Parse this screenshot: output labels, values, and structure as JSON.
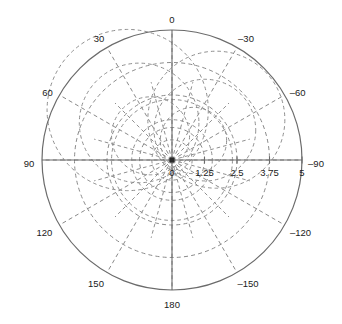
{
  "figure": {
    "name": "polar-plot",
    "background": "#ffffff",
    "axis_color": "#6b6b6b",
    "grid_color": "#8a8a8a",
    "text_color": "#1a1a1a"
  },
  "chart_data": {
    "type": "line",
    "title": "",
    "subtitle": "",
    "xlabel": "",
    "ylabel": "",
    "projection": "polar",
    "grid": true,
    "legend": false,
    "legend_position": "none",
    "center_px": [
      172,
      160
    ],
    "outer_radius_px": 130,
    "radial_axis": {
      "label": "",
      "min": 0,
      "max": 5,
      "ticks": [
        0,
        1.25,
        2.5,
        3.75,
        5
      ],
      "tick_labels": [
        "0",
        "1.25",
        "2.5",
        "3.75",
        "5"
      ],
      "gridline_values": [
        1.25,
        2.5,
        3.75
      ],
      "tick_label_angle_deg": -90
    },
    "angular_axis": {
      "label": "",
      "units": "degrees",
      "direction": "clockwise-negative",
      "zero_location": "top",
      "ticks": [
        0,
        -30,
        -60,
        -90,
        -120,
        -150,
        180,
        150,
        120,
        90,
        60,
        30
      ],
      "tick_labels": [
        "0",
        "–30",
        "–60",
        "–90",
        "–120",
        "–150",
        "180",
        "150",
        "120",
        "90",
        "60",
        "30"
      ],
      "spoke_interval_deg": 30
    },
    "series": [
      {
        "name": "grid-circles-primary",
        "kind": "concentric-dashed-circles",
        "values": [
          1.25,
          2.5,
          3.75
        ]
      },
      {
        "name": "grid-spokes-primary",
        "kind": "radial-dashed-spokes",
        "values": [
          0,
          30,
          60,
          90,
          120,
          150,
          180,
          210,
          240,
          270,
          300,
          330
        ]
      },
      {
        "name": "grid-overlay-upper",
        "kind": "secondary-dashed-polar-grid",
        "center_offset": [
          0,
          0
        ],
        "rotation_deg": 15,
        "scale": 0.62,
        "circle_values": [
          1.25,
          2.5,
          3.75
        ],
        "spoke_values": [
          0,
          30,
          60,
          90,
          120,
          150,
          180,
          210,
          240,
          270,
          300,
          330
        ]
      }
    ]
  },
  "labels": {
    "angular": [
      {
        "text": "0",
        "deg": 0,
        "dx": 0,
        "dy": -10
      },
      {
        "text": "–30",
        "deg": -30,
        "dx": 9,
        "dy": -8
      },
      {
        "text": "–60",
        "deg": -60,
        "dx": 13,
        "dy": -2
      },
      {
        "text": "–90",
        "deg": -90,
        "dx": 14,
        "dy": 4
      },
      {
        "text": "–120",
        "deg": -120,
        "dx": 16,
        "dy": 8
      },
      {
        "text": "–150",
        "deg": -150,
        "dx": 11,
        "dy": 12
      },
      {
        "text": "180",
        "deg": 180,
        "dx": 0,
        "dy": 15
      },
      {
        "text": "150",
        "deg": 150,
        "dx": -11,
        "dy": 12
      },
      {
        "text": "120",
        "deg": 120,
        "dx": -15,
        "dy": 8
      },
      {
        "text": "90",
        "deg": 90,
        "dx": -13,
        "dy": 4
      },
      {
        "text": "60",
        "deg": 60,
        "dx": -12,
        "dy": -2
      },
      {
        "text": "30",
        "deg": 30,
        "dx": -8,
        "dy": -8
      }
    ],
    "radial": [
      {
        "text": "0",
        "r": 0
      },
      {
        "text": "1.25",
        "r": 1.25
      },
      {
        "text": "2.5",
        "r": 2.5
      },
      {
        "text": "3.75",
        "r": 3.75
      },
      {
        "text": "5",
        "r": 5
      }
    ]
  }
}
